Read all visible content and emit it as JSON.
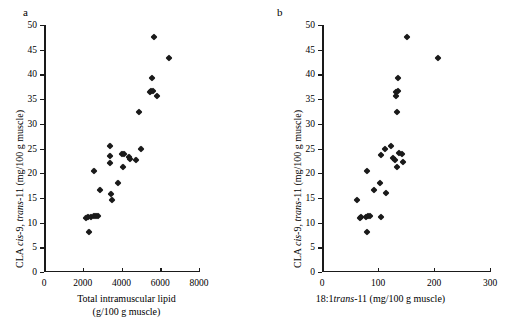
{
  "figure": {
    "panels": [
      {
        "label": "a",
        "x_axis": {
          "title_line1": "Total intramuscular lipid",
          "title_line2": "(g/100 g muscle)",
          "ticks": [
            0,
            2000,
            4000,
            6000,
            8000
          ],
          "min": 0,
          "max": 8000
        },
        "y_axis": {
          "title_prefix": "CLA ",
          "title_italic1": "cis",
          "title_mid": "-9, ",
          "title_italic2": "trans",
          "title_suffix": "-11 (mg/100 g muscle)",
          "ticks": [
            0,
            5,
            10,
            15,
            20,
            25,
            30,
            35,
            40,
            45,
            50
          ],
          "min": 0,
          "max": 50
        }
      },
      {
        "label": "b",
        "x_axis": {
          "title_prefix": "18:1",
          "title_italic1": "trans",
          "title_suffix": "-11 (mg/100 g muscle)",
          "ticks": [
            0,
            100,
            200,
            300
          ],
          "min": 0,
          "max": 300
        },
        "y_axis": {
          "title_prefix": "CLA ",
          "title_italic1": "cis",
          "title_mid": "-9, ",
          "title_italic2": "trans",
          "title_suffix": "-11 (mg/100 g muscle)",
          "ticks": [
            0,
            5,
            10,
            15,
            20,
            25,
            30,
            35,
            40,
            45,
            50
          ],
          "min": 0,
          "max": 50
        }
      }
    ]
  },
  "chart_data": [
    {
      "type": "scatter",
      "panel": "a",
      "title": "",
      "xlabel": "Total intramuscular lipid (g/100 g muscle)",
      "ylabel": "CLA cis-9, trans-11 (mg/100 g muscle)",
      "xlim": [
        0,
        8000
      ],
      "ylim": [
        0,
        50
      ],
      "grid": false,
      "legend": false,
      "marker": "diamond",
      "marker_color": "#1a1a1a",
      "points": [
        {
          "x": 2150,
          "y": 11.0
        },
        {
          "x": 2250,
          "y": 11.1
        },
        {
          "x": 2300,
          "y": 8.1
        },
        {
          "x": 2400,
          "y": 11.2
        },
        {
          "x": 2600,
          "y": 11.3
        },
        {
          "x": 2700,
          "y": 11.3
        },
        {
          "x": 2800,
          "y": 11.3
        },
        {
          "x": 2600,
          "y": 20.5
        },
        {
          "x": 2900,
          "y": 16.6
        },
        {
          "x": 3400,
          "y": 25.6
        },
        {
          "x": 3400,
          "y": 23.5
        },
        {
          "x": 3400,
          "y": 22.1
        },
        {
          "x": 3450,
          "y": 15.7
        },
        {
          "x": 3500,
          "y": 14.6
        },
        {
          "x": 3800,
          "y": 18.1
        },
        {
          "x": 4050,
          "y": 23.9
        },
        {
          "x": 4150,
          "y": 23.9
        },
        {
          "x": 4100,
          "y": 21.2
        },
        {
          "x": 4400,
          "y": 23.2
        },
        {
          "x": 4450,
          "y": 22.8
        },
        {
          "x": 4750,
          "y": 22.7
        },
        {
          "x": 5000,
          "y": 24.9
        },
        {
          "x": 4900,
          "y": 32.4
        },
        {
          "x": 5450,
          "y": 36.5
        },
        {
          "x": 5500,
          "y": 36.6
        },
        {
          "x": 5600,
          "y": 36.7
        },
        {
          "x": 5550,
          "y": 39.2
        },
        {
          "x": 5850,
          "y": 35.6
        },
        {
          "x": 5700,
          "y": 47.6
        },
        {
          "x": 6450,
          "y": 43.4
        }
      ]
    },
    {
      "type": "scatter",
      "panel": "b",
      "title": "",
      "xlabel": "18:1trans-11 (mg/100 g muscle)",
      "ylabel": "CLA cis-9, trans-11 (mg/100 g muscle)",
      "xlim": [
        0,
        300
      ],
      "ylim": [
        0,
        50
      ],
      "grid": false,
      "legend": false,
      "marker": "diamond",
      "marker_color": "#1a1a1a",
      "points": [
        {
          "x": 62,
          "y": 14.6
        },
        {
          "x": 68,
          "y": 11.0
        },
        {
          "x": 70,
          "y": 11.1
        },
        {
          "x": 78,
          "y": 11.2
        },
        {
          "x": 82,
          "y": 11.3
        },
        {
          "x": 86,
          "y": 11.3
        },
        {
          "x": 80,
          "y": 8.1
        },
        {
          "x": 80,
          "y": 20.5
        },
        {
          "x": 92,
          "y": 16.6
        },
        {
          "x": 105,
          "y": 23.7
        },
        {
          "x": 105,
          "y": 11.2
        },
        {
          "x": 103,
          "y": 18.1
        },
        {
          "x": 113,
          "y": 24.9
        },
        {
          "x": 114,
          "y": 15.9
        },
        {
          "x": 124,
          "y": 25.6
        },
        {
          "x": 126,
          "y": 23.0
        },
        {
          "x": 131,
          "y": 22.7
        },
        {
          "x": 134,
          "y": 21.2
        },
        {
          "x": 138,
          "y": 24.1
        },
        {
          "x": 143,
          "y": 23.9
        },
        {
          "x": 145,
          "y": 22.2
        },
        {
          "x": 134,
          "y": 32.4
        },
        {
          "x": 133,
          "y": 35.6
        },
        {
          "x": 132,
          "y": 36.5
        },
        {
          "x": 135,
          "y": 36.7
        },
        {
          "x": 136,
          "y": 39.2
        },
        {
          "x": 152,
          "y": 47.6
        },
        {
          "x": 208,
          "y": 43.4
        }
      ]
    }
  ]
}
